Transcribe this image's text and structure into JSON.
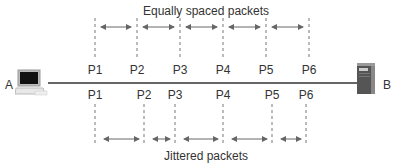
{
  "diagram": {
    "top_title": "Equally spaced packets",
    "bottom_title": "Jittered packets",
    "endpoint_a": {
      "label": "A",
      "icon": "computer-icon"
    },
    "endpoint_b": {
      "label": "B",
      "icon": "server-icon"
    },
    "link": {
      "from": "A",
      "to": "B",
      "y": 83
    },
    "top_packets": [
      {
        "label": "P1",
        "x": 95
      },
      {
        "label": "P2",
        "x": 137
      },
      {
        "label": "P3",
        "x": 180
      },
      {
        "label": "P4",
        "x": 223
      },
      {
        "label": "P5",
        "x": 266
      },
      {
        "label": "P6",
        "x": 309
      }
    ],
    "bottom_packets": [
      {
        "label": "P1",
        "x": 95
      },
      {
        "label": "P2",
        "x": 144
      },
      {
        "label": "P3",
        "x": 175
      },
      {
        "label": "P4",
        "x": 223
      },
      {
        "label": "P5",
        "x": 272
      },
      {
        "label": "P6",
        "x": 306
      }
    ],
    "colors": {
      "line": "#333333",
      "dash": "#777777",
      "arrow": "#666666",
      "text": "#333333"
    }
  }
}
